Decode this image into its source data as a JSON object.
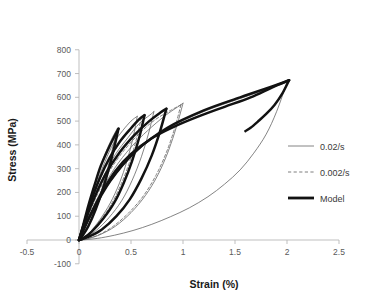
{
  "chart_data": {
    "type": "line",
    "title": "",
    "xlabel": "Strain (%)",
    "ylabel": "Stress (MPa)",
    "xlim": [
      -0.5,
      2.5
    ],
    "ylim": [
      -100,
      800
    ],
    "xticks": [
      "-0.5",
      "0",
      "0.5",
      "1",
      "1.5",
      "2",
      "2.5"
    ],
    "xtick_values": [
      -0.5,
      0,
      0.5,
      1,
      1.5,
      2,
      2.5
    ],
    "yticks": [
      "-100",
      "0",
      "100",
      "200",
      "300",
      "400",
      "500",
      "600",
      "700",
      "800"
    ],
    "ytick_values": [
      -100,
      0,
      100,
      200,
      300,
      400,
      500,
      600,
      700,
      800
    ],
    "grid": false,
    "legend_position": "right",
    "legend": [
      {
        "name": "0.02/s",
        "style": "thin-solid",
        "color": "#5b5b5b",
        "width": 0.8
      },
      {
        "name": "0.002/s",
        "style": "dashed",
        "color": "#6e6e6e",
        "width": 0.9
      },
      {
        "name": "Model",
        "style": "thick-solid",
        "color": "#121212",
        "width": 2.6
      }
    ],
    "series": [
      {
        "name": "0.02/s",
        "style": "thin-solid",
        "loops": [
          {
            "load": [
              [
                0,
                0
              ],
              [
                0.04,
                60
              ],
              [
                0.09,
                140
              ],
              [
                0.14,
                220
              ],
              [
                0.2,
                300
              ],
              [
                0.26,
                372
              ],
              [
                0.32,
                430
              ],
              [
                0.37,
                470
              ]
            ],
            "unload": [
              [
                0.37,
                470
              ],
              [
                0.33,
                400
              ],
              [
                0.28,
                310
              ],
              [
                0.22,
                215
              ],
              [
                0.15,
                125
              ],
              [
                0.08,
                55
              ],
              [
                0.03,
                15
              ],
              [
                0,
                0
              ]
            ]
          },
          {
            "load": [
              [
                0,
                0
              ],
              [
                0.05,
                70
              ],
              [
                0.11,
                160
              ],
              [
                0.18,
                250
              ],
              [
                0.25,
                330
              ],
              [
                0.33,
                405
              ],
              [
                0.42,
                460
              ],
              [
                0.5,
                500
              ],
              [
                0.56,
                520
              ]
            ],
            "unload": [
              [
                0.56,
                520
              ],
              [
                0.52,
                430
              ],
              [
                0.46,
                330
              ],
              [
                0.39,
                240
              ],
              [
                0.3,
                155
              ],
              [
                0.2,
                85
              ],
              [
                0.1,
                30
              ],
              [
                0.03,
                6
              ],
              [
                0,
                0
              ]
            ]
          },
          {
            "load": [
              [
                0,
                0
              ],
              [
                0.06,
                78
              ],
              [
                0.14,
                175
              ],
              [
                0.24,
                272
              ],
              [
                0.35,
                360
              ],
              [
                0.47,
                430
              ],
              [
                0.58,
                490
              ],
              [
                0.68,
                525
              ],
              [
                0.72,
                540
              ]
            ],
            "unload": [
              [
                0.72,
                540
              ],
              [
                0.67,
                450
              ],
              [
                0.6,
                350
              ],
              [
                0.51,
                250
              ],
              [
                0.41,
                165
              ],
              [
                0.29,
                95
              ],
              [
                0.17,
                42
              ],
              [
                0.07,
                12
              ],
              [
                0,
                0
              ]
            ]
          },
          {
            "load": [
              [
                0,
                0
              ],
              [
                0.08,
                85
              ],
              [
                0.2,
                195
              ],
              [
                0.34,
                300
              ],
              [
                0.5,
                390
              ],
              [
                0.66,
                460
              ],
              [
                0.82,
                520
              ],
              [
                0.95,
                560
              ],
              [
                1.0,
                575
              ]
            ],
            "unload": [
              [
                1.0,
                575
              ],
              [
                0.94,
                480
              ],
              [
                0.86,
                375
              ],
              [
                0.76,
                275
              ],
              [
                0.64,
                188
              ],
              [
                0.5,
                115
              ],
              [
                0.35,
                58
              ],
              [
                0.2,
                22
              ],
              [
                0.08,
                5
              ],
              [
                0,
                0
              ]
            ]
          },
          {
            "load": [
              [
                0,
                0
              ],
              [
                0.1,
                95
              ],
              [
                0.3,
                245
              ],
              [
                0.55,
                370
              ],
              [
                0.85,
                468
              ],
              [
                1.2,
                540
              ],
              [
                1.55,
                595
              ],
              [
                1.85,
                640
              ],
              [
                2.0,
                663
              ]
            ],
            "unload": [
              [
                2.0,
                663
              ],
              [
                1.9,
                540
              ],
              [
                1.8,
                445
              ],
              [
                1.68,
                365
              ],
              [
                1.55,
                295
              ],
              [
                1.4,
                235
              ],
              [
                1.24,
                182
              ],
              [
                1.06,
                135
              ],
              [
                0.88,
                98
              ],
              [
                0.7,
                66
              ],
              [
                0.52,
                40
              ],
              [
                0.34,
                20
              ],
              [
                0.18,
                7
              ],
              [
                0.05,
                1
              ],
              [
                0,
                0
              ]
            ]
          }
        ]
      },
      {
        "name": "0.002/s",
        "style": "dashed",
        "loops": [
          {
            "load": [
              [
                0,
                0
              ],
              [
                0.05,
                72
              ],
              [
                0.12,
                165
              ],
              [
                0.2,
                255
              ],
              [
                0.29,
                338
              ],
              [
                0.39,
                408
              ],
              [
                0.49,
                462
              ],
              [
                0.56,
                500
              ],
              [
                0.6,
                515
              ]
            ],
            "unload": [
              [
                0.6,
                515
              ],
              [
                0.55,
                420
              ],
              [
                0.48,
                320
              ],
              [
                0.4,
                230
              ],
              [
                0.31,
                150
              ],
              [
                0.21,
                85
              ],
              [
                0.11,
                33
              ],
              [
                0.04,
                8
              ],
              [
                0,
                0
              ]
            ]
          },
          {
            "load": [
              [
                0,
                0
              ],
              [
                0.07,
                82
              ],
              [
                0.17,
                185
              ],
              [
                0.29,
                288
              ],
              [
                0.43,
                375
              ],
              [
                0.58,
                448
              ],
              [
                0.73,
                505
              ],
              [
                0.88,
                545
              ],
              [
                0.98,
                568
              ]
            ],
            "unload": [
              [
                0.98,
                568
              ],
              [
                0.92,
                470
              ],
              [
                0.84,
                368
              ],
              [
                0.74,
                272
              ],
              [
                0.62,
                186
              ],
              [
                0.48,
                115
              ],
              [
                0.33,
                58
              ],
              [
                0.19,
                22
              ],
              [
                0.07,
                5
              ],
              [
                0,
                0
              ]
            ]
          }
        ]
      },
      {
        "name": "Model",
        "style": "thick-solid",
        "loops": [
          {
            "load": [
              [
                0,
                0
              ],
              [
                0.04,
                62
              ],
              [
                0.09,
                145
              ],
              [
                0.15,
                232
              ],
              [
                0.21,
                312
              ],
              [
                0.28,
                382
              ],
              [
                0.34,
                435
              ],
              [
                0.38,
                468
              ]
            ],
            "unload": [
              [
                0.38,
                468
              ],
              [
                0.34,
                392
              ],
              [
                0.29,
                305
              ],
              [
                0.23,
                215
              ],
              [
                0.16,
                128
              ],
              [
                0.09,
                58
              ],
              [
                0.03,
                16
              ],
              [
                0,
                0
              ]
            ]
          },
          {
            "load": [
              [
                0,
                0
              ],
              [
                0.05,
                72
              ],
              [
                0.12,
                168
              ],
              [
                0.2,
                260
              ],
              [
                0.29,
                342
              ],
              [
                0.39,
                412
              ],
              [
                0.5,
                470
              ],
              [
                0.58,
                508
              ],
              [
                0.63,
                525
              ]
            ],
            "unload": [
              [
                0.63,
                525
              ],
              [
                0.58,
                432
              ],
              [
                0.51,
                332
              ],
              [
                0.43,
                240
              ],
              [
                0.34,
                158
              ],
              [
                0.23,
                88
              ],
              [
                0.12,
                34
              ],
              [
                0.04,
                7
              ],
              [
                0,
                0
              ]
            ]
          },
          {
            "load": [
              [
                0,
                0
              ],
              [
                0.06,
                80
              ],
              [
                0.15,
                180
              ],
              [
                0.26,
                280
              ],
              [
                0.39,
                368
              ],
              [
                0.53,
                440
              ],
              [
                0.67,
                498
              ],
              [
                0.78,
                535
              ],
              [
                0.84,
                552
              ]
            ],
            "unload": [
              [
                0.84,
                552
              ],
              [
                0.78,
                458
              ],
              [
                0.7,
                356
              ],
              [
                0.6,
                258
              ],
              [
                0.49,
                172
              ],
              [
                0.36,
                100
              ],
              [
                0.22,
                44
              ],
              [
                0.09,
                13
              ],
              [
                0,
                0
              ]
            ]
          },
          {
            "load": [
              [
                0,
                0
              ],
              [
                0.1,
                96
              ],
              [
                0.3,
                248
              ],
              [
                0.55,
                375
              ],
              [
                0.85,
                472
              ],
              [
                1.2,
                545
              ],
              [
                1.55,
                600
              ],
              [
                1.85,
                645
              ],
              [
                2.02,
                672
              ]
            ],
            "unload": [
              [
                2.02,
                672
              ],
              [
                1.95,
                612
              ],
              [
                1.88,
                568
              ],
              [
                1.8,
                530
              ],
              [
                1.72,
                498
              ],
              [
                1.65,
                472
              ],
              [
                1.6,
                458
              ]
            ]
          }
        ]
      }
    ],
    "envelope": {
      "name": "monotonic envelope",
      "points": [
        [
          0,
          0
        ],
        [
          0.1,
          96
        ],
        [
          0.22,
          200
        ],
        [
          0.35,
          290
        ],
        [
          0.5,
          362
        ],
        [
          0.7,
          428
        ],
        [
          0.9,
          474
        ],
        [
          1.15,
          520
        ],
        [
          1.4,
          560
        ],
        [
          1.65,
          600
        ],
        [
          1.85,
          640
        ],
        [
          2.02,
          672
        ]
      ]
    },
    "annotations": {
      "peak_stress": 675,
      "peak_strain": 2.0
    }
  }
}
